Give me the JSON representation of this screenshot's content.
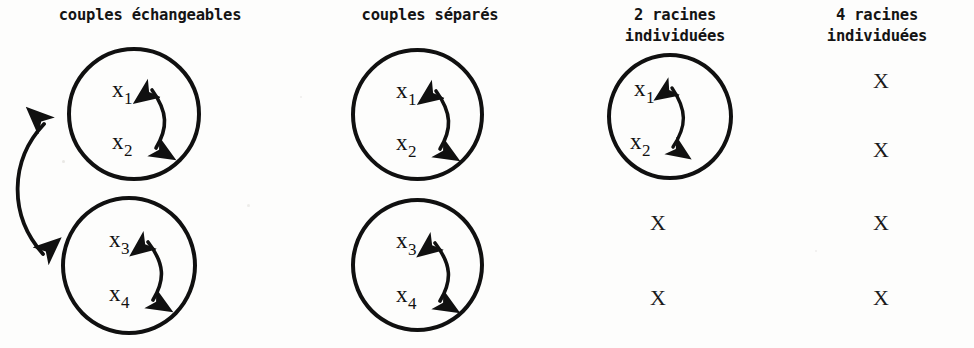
{
  "figure": {
    "background_color": "#fdfdfc",
    "ink_color": "#101010",
    "columns": [
      {
        "id": "couples-echangeables",
        "header": "couples échangeables",
        "cells": [
          {
            "kind": "circle",
            "labels": [
              "x1",
              "x2"
            ],
            "internal_arrow": "double-headed-vertical"
          },
          {
            "kind": "circle",
            "labels": [
              "x3",
              "x4"
            ],
            "internal_arrow": "double-headed-vertical"
          }
        ],
        "between_circles_arrow": "double-headed-curved-left"
      },
      {
        "id": "couples-separes",
        "header": "couples séparés",
        "cells": [
          {
            "kind": "circle",
            "labels": [
              "x1",
              "x2"
            ],
            "internal_arrow": "double-headed-vertical"
          },
          {
            "kind": "circle",
            "labels": [
              "x3",
              "x4"
            ],
            "internal_arrow": "double-headed-vertical"
          }
        ],
        "between_circles_arrow": "none"
      },
      {
        "id": "2-racines-individuees",
        "header": "2 racines\nindividuées",
        "cells": [
          {
            "kind": "circle",
            "labels": [
              "x1",
              "x2"
            ],
            "internal_arrow": "double-headed-vertical"
          },
          {
            "kind": "x",
            "mark": "X"
          },
          {
            "kind": "x",
            "mark": "X"
          }
        ],
        "between_circles_arrow": "none"
      },
      {
        "id": "4-racines-individuees",
        "header": "4 racines\nindividuées",
        "cells": [
          {
            "kind": "x",
            "mark": "X"
          },
          {
            "kind": "x",
            "mark": "X"
          },
          {
            "kind": "x",
            "mark": "X"
          },
          {
            "kind": "x",
            "mark": "X"
          }
        ],
        "between_circles_arrow": "none"
      }
    ],
    "variables": {
      "x1_base": "x",
      "x1_sub": "1",
      "x2_base": "x",
      "x2_sub": "2",
      "x3_base": "x",
      "x3_sub": "3",
      "x4_base": "x",
      "x4_sub": "4"
    },
    "x_mark": "X"
  }
}
